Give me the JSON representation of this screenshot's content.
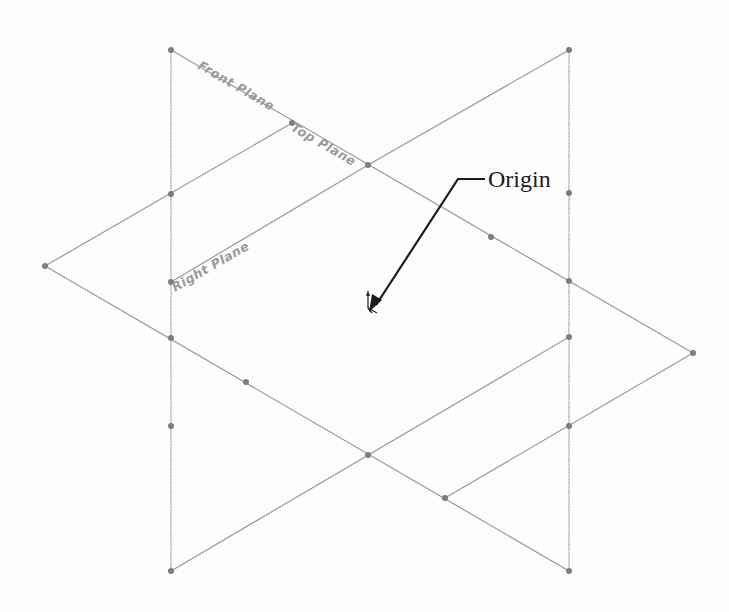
{
  "diagram": {
    "title": "",
    "labels": {
      "front_plane": "Front Plane",
      "top_plane": "Top Plane",
      "right_plane": "Right Plane",
      "origin": "Origin"
    },
    "colors": {
      "edge": "#9a9a9a",
      "vertex": "#7d7d7d",
      "callout": "#1a1a1a",
      "background": "#fdfdfd"
    },
    "planes": [
      {
        "name": "Front Plane",
        "orientation": "front"
      },
      {
        "name": "Top Plane",
        "orientation": "top"
      },
      {
        "name": "Right Plane",
        "orientation": "right"
      }
    ],
    "callout": {
      "text": "Origin",
      "target": "origin-triad"
    }
  }
}
